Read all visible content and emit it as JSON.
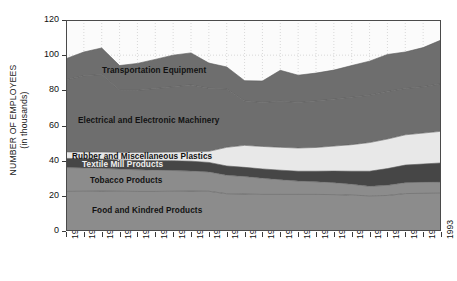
{
  "figure": {
    "background": "#ffffff",
    "plot_background": "#fbfbfb",
    "frame_color": "#4a4a4a",
    "faint_title": ""
  },
  "axes": {
    "y_label_line1": "NUMBER OF EMPLOYEES",
    "y_label_line2": "(in thousands)",
    "y_ticks": [
      "0",
      "20",
      "40",
      "60",
      "80",
      "100",
      "120"
    ],
    "x_ticks": [
      "1972",
      "1973",
      "1974",
      "1975",
      "1976",
      "1977",
      "1978",
      "1979",
      "1980",
      "1981",
      "1982",
      "1983",
      "1984",
      "1985",
      "1986",
      "1987",
      "1988",
      "1989",
      "1990",
      "1991",
      "1992",
      "1993"
    ]
  },
  "chart_data": {
    "type": "area",
    "stacked": true,
    "title": "",
    "xlabel": "",
    "ylabel": "NUMBER OF EMPLOYEES (in thousands)",
    "ylim": [
      0,
      120
    ],
    "ytick_step": 20,
    "grid": true,
    "grid_style": "dotted",
    "legend_position": "inline-band-labels",
    "x": [
      "1972",
      "1973",
      "1974",
      "1975",
      "1976",
      "1977",
      "1978",
      "1979",
      "1980",
      "1981",
      "1982",
      "1983",
      "1984",
      "1985",
      "1986",
      "1987",
      "1988",
      "1989",
      "1990",
      "1991",
      "1992",
      "1993"
    ],
    "series": [
      {
        "name": "Food and Kindred Products",
        "color": "#8c8c8c",
        "label_color": "#121212",
        "values": [
          22.5,
          22.6,
          22.7,
          22.6,
          22.5,
          22.5,
          22.6,
          22.7,
          22.6,
          21.2,
          21.0,
          20.8,
          20.8,
          20.8,
          20.8,
          20.7,
          20.4,
          20.0,
          20.2,
          21.3,
          21.4,
          21.5
        ]
      },
      {
        "name": "Tobacco Products",
        "color": "#8c8c8c",
        "label_color": "#121212",
        "values": [
          13.6,
          13.3,
          12.9,
          12.6,
          12.3,
          12.1,
          11.8,
          11.4,
          11.0,
          10.5,
          10.0,
          9.2,
          8.4,
          7.6,
          7.2,
          6.8,
          6.2,
          5.4,
          5.8,
          6.2,
          6.3,
          6.4
        ]
      },
      {
        "name": "Textile Mill Products",
        "color": "#464646",
        "label_color": "#f0f0f0",
        "values": [
          5.2,
          5.2,
          5.3,
          5.2,
          5.3,
          5.4,
          5.5,
          5.6,
          5.4,
          5.3,
          5.2,
          5.3,
          5.4,
          5.6,
          6.0,
          6.6,
          7.4,
          8.6,
          9.5,
          10.0,
          10.4,
          10.8
        ]
      },
      {
        "name": "Rubber and Miscellaneous Plastics",
        "color": "#e8e8e8",
        "label_color": "#121212",
        "values": [
          3.7,
          3.8,
          4.0,
          4.3,
          4.5,
          4.7,
          5.0,
          5.4,
          6.3,
          10.6,
          12.5,
          12.8,
          13.0,
          13.2,
          13.5,
          14.2,
          15.1,
          16.3,
          16.8,
          17.2,
          17.6,
          18.0
        ]
      },
      {
        "name": "Electrical and Electronic Machinery",
        "color": "#6e6e6e",
        "label_color": "#121212",
        "values": [
          41.0,
          43.4,
          44.1,
          35.3,
          35.4,
          36.3,
          37.2,
          38.0,
          35.9,
          33.2,
          25.3,
          25.0,
          26.2,
          25.9,
          26.5,
          26.7,
          27.0,
          26.9,
          27.1,
          26.3,
          26.4,
          27.0
        ]
      },
      {
        "name": "Transportation Equipment",
        "color": "#6e6e6e",
        "label_color": "#121212",
        "values": [
          12.0,
          13.5,
          15.1,
          14.1,
          15.3,
          16.6,
          17.9,
          18.2,
          14.3,
          12.5,
          11.5,
          12.2,
          17.6,
          15.5,
          15.8,
          16.5,
          18.0,
          19.4,
          21.0,
          20.8,
          22.2,
          24.9
        ]
      }
    ],
    "stack_tops": {
      "1972": [
        22.5,
        36.1,
        41.3,
        45.0,
        86.0,
        98.0
      ],
      "1993": [
        21.5,
        27.9,
        38.7,
        56.7,
        83.7,
        108.6
      ]
    }
  },
  "band_labels": [
    {
      "text": "Transportation Equipment",
      "series": "Transportation Equipment"
    },
    {
      "text": "Electrical and Electronic Machinery",
      "series": "Electrical and Electronic Machinery"
    },
    {
      "text": "Rubber and Miscellaneous Plastics",
      "series": "Rubber and Miscellaneous Plastics"
    },
    {
      "text": "Textile Mill Products",
      "series": "Textile Mill Products"
    },
    {
      "text": "Tobacco Products",
      "series": "Tobacco Products"
    },
    {
      "text": "Food and Kindred Products",
      "series": "Food and Kindred Products"
    }
  ]
}
